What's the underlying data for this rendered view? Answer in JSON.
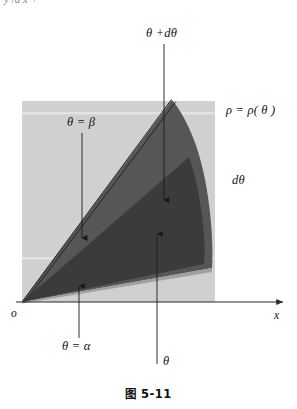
{
  "figure": {
    "caption": "图 5-11",
    "cropped_top_text": "y /d x +",
    "labels": {
      "theta_plus_dtheta": "θ +dθ",
      "rho_function": "ρ = ρ( θ )",
      "dtheta": "dθ",
      "theta_equals_beta": "θ = β",
      "theta_equals_alpha": "θ = α",
      "theta": "θ",
      "origin": "o",
      "x_axis": "x"
    },
    "colors": {
      "panel_background": "#d0d0d0",
      "sector_mid_gray": "#565656",
      "sector_dark_gray": "#3b3b3b",
      "sector_light_gray": "#9a9a9a",
      "axis_line": "#2b2b2b",
      "leader_line": "#1a1a1a",
      "page_background": "#ffffff"
    },
    "geometry": {
      "origin_point": [
        22,
        302
      ],
      "panel_rect": [
        22,
        101,
        193,
        201
      ],
      "x_axis_y": 302,
      "x_axis_end": [
        288,
        302
      ],
      "ray_alpha_end": [
        212,
        268
      ],
      "ray_beta_end": [
        172,
        100
      ],
      "outer_curve_max_x": 212
    }
  }
}
